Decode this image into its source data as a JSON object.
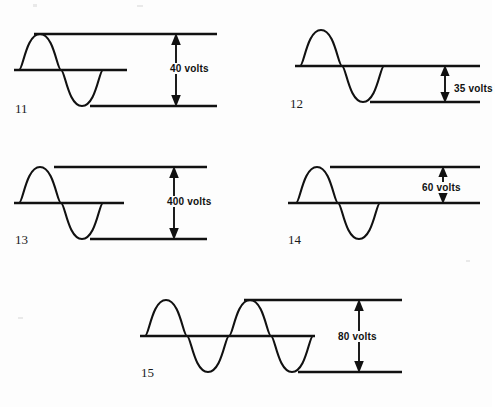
{
  "page": {
    "background_color": "#fdfdfd",
    "ink_color": "#111111",
    "width": 492,
    "height": 407
  },
  "figures": [
    {
      "id": "fig-11",
      "number": "11",
      "value": "40",
      "unit": "volts",
      "label": "40 volts",
      "cycles": 1,
      "measurement": "peak-to-peak",
      "top_rule": "at positive peak",
      "mid_rule": "zero baseline",
      "bottom_rule": "at negative trough"
    },
    {
      "id": "fig-12",
      "number": "12",
      "value": "35",
      "unit": "volts",
      "label": "35 volts",
      "cycles": 1,
      "measurement": "baseline-to-trough",
      "top_rule": "zero baseline",
      "mid_rule": "",
      "bottom_rule": "at negative trough"
    },
    {
      "id": "fig-13",
      "number": "13",
      "value": "400",
      "unit": "volts",
      "label": "400 volts",
      "cycles": 1,
      "measurement": "peak-to-peak",
      "top_rule": "at positive peak",
      "mid_rule": "zero baseline",
      "bottom_rule": "at negative trough"
    },
    {
      "id": "fig-14",
      "number": "14",
      "value": "60",
      "unit": "volts",
      "label": "60 volts",
      "cycles": 1,
      "measurement": "peak-to-baseline",
      "top_rule": "at positive peak",
      "mid_rule": "",
      "bottom_rule": "zero baseline"
    },
    {
      "id": "fig-15",
      "number": "15",
      "value": "80",
      "unit": "volts",
      "label": "80 volts",
      "cycles": 2,
      "measurement": "peak-to-peak",
      "top_rule": "at positive peak",
      "mid_rule": "zero baseline",
      "bottom_rule": "at negative trough"
    }
  ]
}
